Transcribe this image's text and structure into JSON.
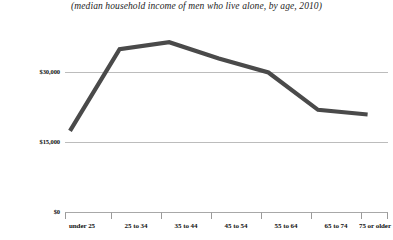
{
  "chart_data": {
    "type": "line",
    "title": "(median household income of men who live alone, by age, 2010)",
    "xlabel": "",
    "ylabel": "",
    "categories": [
      "under 25",
      "25 to 34",
      "35 to 44",
      "45 to 54",
      "55 to 64",
      "65 to 74",
      "75 or older"
    ],
    "values": [
      17500,
      35000,
      36500,
      33000,
      30000,
      22000,
      21000
    ],
    "series": [
      {
        "name": "median household income",
        "values": [
          17500,
          35000,
          36500,
          33000,
          30000,
          22000,
          21000
        ]
      }
    ],
    "ylim": [
      0,
      45000
    ],
    "ytick_values": [
      0,
      15000,
      30000
    ],
    "ytick_labels": [
      "$0",
      "$15,000",
      "$30,000"
    ],
    "grid": "horizontal",
    "legend": "none",
    "line_color": "#4a4a4a",
    "gridline_color": "#b8b8b8",
    "axis_color": "#9a9a9a"
  },
  "axis": {
    "y_labels": [
      "$30,000",
      "$15,000",
      "$0"
    ],
    "x_labels": [
      "under 25",
      "25 to 34",
      "35 to 44",
      "45 to 54",
      "55 to 64",
      "65 to 74",
      "75 or older"
    ]
  }
}
